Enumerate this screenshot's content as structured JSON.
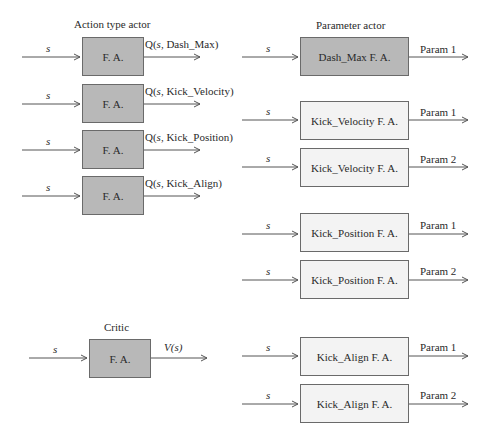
{
  "diagram": {
    "action_type_actor": {
      "title": "Action type actor",
      "input_label": "s",
      "units": [
        {
          "box": "F. A.",
          "output_prefix": "Q(",
          "output_var": "s",
          "output_suffix": ", Dash_Max)"
        },
        {
          "box": "F. A.",
          "output_prefix": "Q(",
          "output_var": "s",
          "output_suffix": ", Kick_Velocity)"
        },
        {
          "box": "F. A.",
          "output_prefix": "Q(",
          "output_var": "s",
          "output_suffix": ", Kick_Position)"
        },
        {
          "box": "F. A.",
          "output_prefix": "Q(",
          "output_var": "s",
          "output_suffix": ", Kick_Align)"
        }
      ]
    },
    "critic": {
      "title": "Critic",
      "input_label": "s",
      "box": "F. A.",
      "output": "V(s)"
    },
    "parameter_actor": {
      "title": "Parameter actor",
      "input_label": "s",
      "units": [
        {
          "box": "Dash_Max F. A.",
          "output": "Param 1"
        },
        {
          "box": "Kick_Velocity F. A.",
          "output": "Param 1"
        },
        {
          "box": "Kick_Velocity F. A.",
          "output": "Param 2"
        },
        {
          "box": "Kick_Position F. A.",
          "output": "Param 1"
        },
        {
          "box": "Kick_Position F. A.",
          "output": "Param 2"
        },
        {
          "box": "Kick_Align F. A.",
          "output": "Param 1"
        },
        {
          "box": "Kick_Align F. A.",
          "output": "Param 2"
        }
      ]
    },
    "colors": {
      "dark_box": "#b8b8b8",
      "light_box": "#f3f3f3",
      "line": "#555555"
    }
  }
}
